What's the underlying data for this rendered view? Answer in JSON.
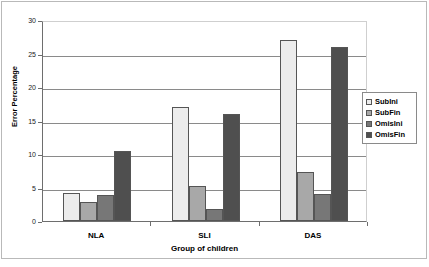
{
  "chart_data": {
    "type": "bar",
    "title": "",
    "xlabel": "Group of children",
    "ylabel": "Error Percentage",
    "categories": [
      "NLA",
      "SLI",
      "DAS"
    ],
    "series": [
      {
        "name": "SubIni",
        "color": "#ececec",
        "values": [
          4.2,
          17.0,
          27.0
        ]
      },
      {
        "name": "SubFin",
        "color": "#a8a8a8",
        "values": [
          2.9,
          5.3,
          7.3
        ]
      },
      {
        "name": "OmisIni",
        "color": "#777777",
        "values": [
          3.9,
          1.8,
          4.0
        ]
      },
      {
        "name": "OmisFin",
        "color": "#4f4f4f",
        "values": [
          10.4,
          16.0,
          26.0
        ]
      }
    ],
    "ylim": [
      0,
      30
    ],
    "yticks": [
      0,
      5,
      10,
      15,
      20,
      25,
      30
    ],
    "ytick_labels": [
      "0",
      "5",
      "10",
      "15",
      "20",
      "25",
      "30"
    ],
    "grid": true,
    "legend_position": "right",
    "legend_entries": [
      "SubIni",
      "SubFin",
      "OmisIni",
      "OmisFin"
    ]
  }
}
